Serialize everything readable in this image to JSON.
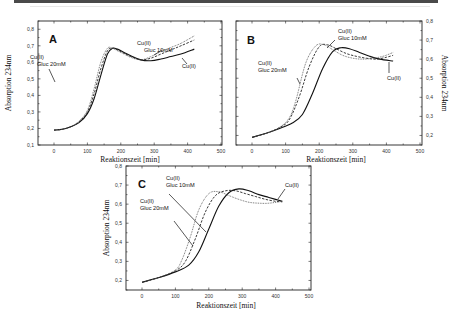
{
  "figure": {
    "legend_series": [
      "Cu(II)",
      "Cu(II) Gluc 10mM",
      "Cu(II) Gluc 20mM"
    ],
    "series_styles": {
      "Cu(II)": {
        "stroke": "#111111",
        "dash": "",
        "width": 1.1
      },
      "Cu(II) Gluc 10mM": {
        "stroke": "#222222",
        "dash": "2.4,1.4",
        "width": 0.9
      },
      "Cu(II) Gluc 20mM": {
        "stroke": "#555555",
        "dash": "0.8,0.9",
        "width": 0.9
      }
    }
  },
  "chart_data": [
    {
      "panel": "A",
      "type": "line",
      "title": "",
      "xlabel": "Reaktionszeit [min]",
      "ylabel": "Absorption 234nm",
      "ylabel_side": "left",
      "xlim": [
        -50,
        500
      ],
      "ylim": [
        0.1,
        0.85
      ],
      "xticks": [
        0,
        100,
        200,
        300,
        400,
        500
      ],
      "yticks": [
        0.1,
        0.2,
        0.3,
        0.4,
        0.5,
        0.6,
        0.7,
        0.8
      ],
      "ytick_labels": [
        "0,1",
        "0,2",
        "0,3",
        "0,4",
        "0,5",
        "0,6",
        "0,7",
        "0,8"
      ],
      "grid": false,
      "annotations": [
        {
          "text": [
            "Cu(II)",
            "Gluc 20mM"
          ],
          "x": 42,
          "y": 0.62
        },
        {
          "text": [
            "Cu(II)",
            "Gluc 10mM"
          ],
          "x": 245,
          "y": 0.77
        },
        {
          "text": [
            "Cu(II)"
          ],
          "x": 380,
          "y": 0.6
        }
      ],
      "series": [
        {
          "name": "Cu(II)",
          "x": [
            0,
            25,
            50,
            75,
            100,
            120,
            140,
            160,
            175,
            190,
            210,
            230,
            260,
            290,
            320,
            350,
            380,
            420
          ],
          "y": [
            0.19,
            0.195,
            0.21,
            0.235,
            0.29,
            0.38,
            0.52,
            0.65,
            0.685,
            0.68,
            0.66,
            0.64,
            0.615,
            0.61,
            0.62,
            0.635,
            0.65,
            0.68
          ]
        },
        {
          "name": "Cu(II) Gluc 10mM",
          "x": [
            0,
            25,
            50,
            75,
            100,
            120,
            140,
            160,
            175,
            190,
            210,
            230,
            260,
            290,
            320,
            350,
            380,
            420
          ],
          "y": [
            0.19,
            0.195,
            0.21,
            0.24,
            0.3,
            0.41,
            0.56,
            0.67,
            0.685,
            0.675,
            0.655,
            0.635,
            0.615,
            0.625,
            0.65,
            0.675,
            0.7,
            0.735
          ]
        },
        {
          "name": "Cu(II) Gluc 20mM",
          "x": [
            0,
            25,
            50,
            75,
            100,
            120,
            140,
            160,
            175,
            190,
            210,
            230,
            260,
            290,
            320,
            350,
            380,
            420
          ],
          "y": [
            0.19,
            0.195,
            0.21,
            0.245,
            0.31,
            0.44,
            0.6,
            0.685,
            0.685,
            0.67,
            0.65,
            0.63,
            0.615,
            0.635,
            0.665,
            0.69,
            0.715,
            0.76
          ]
        }
      ]
    },
    {
      "panel": "B",
      "type": "line",
      "title": "",
      "xlabel": "Reaktionszeit [min]",
      "ylabel": "Absorption 234nm",
      "ylabel_side": "right",
      "xlim": [
        -50,
        500
      ],
      "ylim": [
        0.15,
        0.8
      ],
      "xticks": [
        0,
        100,
        200,
        300,
        400,
        500
      ],
      "yticks": [
        0.2,
        0.3,
        0.4,
        0.5,
        0.6,
        0.7,
        0.8
      ],
      "ytick_labels": [
        "0,2",
        "0,3",
        "0,4",
        "0,5",
        "0,6",
        "0,7",
        "0,8"
      ],
      "grid": false,
      "annotations": [
        {
          "text": [
            "Cu(II)",
            "Gluc 20mM"
          ],
          "x": 40,
          "y": 0.6
        },
        {
          "text": [
            "Cu(II)",
            "Gluc 10mM"
          ],
          "x": 260,
          "y": 0.71
        },
        {
          "text": [
            "Cu(II)"
          ],
          "x": 380,
          "y": 0.54
        }
      ],
      "series": [
        {
          "name": "Cu(II)",
          "x": [
            0,
            40,
            80,
            120,
            150,
            180,
            210,
            240,
            265,
            290,
            320,
            350,
            380,
            420
          ],
          "y": [
            0.19,
            0.21,
            0.235,
            0.265,
            0.31,
            0.42,
            0.55,
            0.64,
            0.66,
            0.655,
            0.635,
            0.615,
            0.6,
            0.59
          ]
        },
        {
          "name": "Cu(II) Gluc 10mM",
          "x": [
            0,
            40,
            80,
            110,
            140,
            170,
            200,
            225,
            250,
            280,
            310,
            340,
            370,
            400,
            420
          ],
          "y": [
            0.19,
            0.21,
            0.24,
            0.28,
            0.4,
            0.56,
            0.665,
            0.675,
            0.655,
            0.63,
            0.615,
            0.605,
            0.6,
            0.61,
            0.62
          ]
        },
        {
          "name": "Cu(II) Gluc 20mM",
          "x": [
            0,
            40,
            80,
            110,
            130,
            160,
            190,
            215,
            240,
            270,
            300,
            330,
            360,
            390,
            420
          ],
          "y": [
            0.19,
            0.21,
            0.24,
            0.29,
            0.38,
            0.58,
            0.67,
            0.675,
            0.65,
            0.62,
            0.605,
            0.6,
            0.605,
            0.615,
            0.635
          ]
        }
      ]
    },
    {
      "panel": "C",
      "type": "line",
      "title": "",
      "xlabel": "Reaktionszeit [min]",
      "ylabel": "Absorption 234nm",
      "ylabel_side": "left",
      "xlim": [
        -50,
        500
      ],
      "ylim": [
        0.15,
        0.8
      ],
      "xticks": [
        0,
        100,
        200,
        300,
        400,
        500
      ],
      "yticks": [
        0.2,
        0.3,
        0.4,
        0.5,
        0.6,
        0.7,
        0.8
      ],
      "ytick_labels": [
        "0,2",
        "0,3",
        "0,4",
        "0,5",
        "0,6",
        "0,7",
        "0,8"
      ],
      "grid": false,
      "annotations": [
        {
          "text": [
            "Cu(II)",
            "Gluc 10mM"
          ],
          "x": 70,
          "y": 0.72
        },
        {
          "text": [
            "Cu(II)",
            "Gluc 20mM"
          ],
          "x": 35,
          "y": 0.6
        },
        {
          "text": [
            "Cu(II)"
          ],
          "x": 420,
          "y": 0.69
        }
      ],
      "series": [
        {
          "name": "Cu(II)",
          "x": [
            0,
            50,
            100,
            140,
            170,
            200,
            230,
            260,
            290,
            320,
            350,
            380,
            420
          ],
          "y": [
            0.19,
            0.215,
            0.245,
            0.28,
            0.35,
            0.47,
            0.59,
            0.66,
            0.68,
            0.67,
            0.65,
            0.635,
            0.615
          ]
        },
        {
          "name": "Cu(II) Gluc 10mM",
          "x": [
            0,
            50,
            100,
            130,
            160,
            190,
            220,
            250,
            280,
            310,
            340,
            370,
            400,
            420
          ],
          "y": [
            0.19,
            0.215,
            0.25,
            0.3,
            0.42,
            0.56,
            0.645,
            0.67,
            0.67,
            0.655,
            0.64,
            0.625,
            0.615,
            0.612
          ]
        },
        {
          "name": "Cu(II) Gluc 20mM",
          "x": [
            0,
            50,
            100,
            120,
            145,
            170,
            200,
            230,
            260,
            290,
            320,
            350,
            380,
            420
          ],
          "y": [
            0.19,
            0.215,
            0.255,
            0.31,
            0.43,
            0.57,
            0.655,
            0.665,
            0.645,
            0.625,
            0.61,
            0.605,
            0.605,
            0.615
          ]
        }
      ]
    }
  ],
  "layout_px": [
    {
      "frame": [
        38,
        21,
        222,
        145
      ],
      "x0px": 54,
      "x500px": 221,
      "ytop": 0.85,
      "ybot": 0.1,
      "yaxis": "left",
      "letter_pos": [
        49,
        43
      ],
      "xlabel_pos": [
        130,
        162
      ],
      "ylabel_pos": [
        11,
        83
      ],
      "annot_px": [
        [
          30,
          59,
          37,
          66
        ],
        [
          137,
          45,
          144,
          52
        ],
        [
          182,
          68
        ]
      ],
      "leaders": [
        [
          49,
          69,
          55,
          82
        ],
        [
          154,
          55,
          162,
          50
        ],
        [
          187,
          64,
          182,
          58
        ]
      ]
    },
    {
      "frame": [
        236,
        21,
        422,
        145
      ],
      "x0px": 252,
      "x500px": 420,
      "ytop": 0.8,
      "ybot": 0.15,
      "yaxis": "right",
      "letter_pos": [
        247,
        44
      ],
      "xlabel_pos": [
        336,
        162
      ],
      "ylabel_pos": [
        442,
        83
      ],
      "annot_px": [
        [
          258,
          65,
          258,
          72
        ],
        [
          338,
          33,
          338,
          40
        ],
        [
          387,
          80
        ]
      ],
      "leaders": [
        [
          297,
          78,
          300,
          84
        ],
        [
          335,
          40,
          327,
          48
        ],
        [
          389,
          73,
          389,
          62
        ]
      ]
    },
    {
      "frame": [
        126,
        166,
        311,
        290
      ],
      "x0px": 142,
      "x500px": 309,
      "ytop": 0.8,
      "ybot": 0.15,
      "yaxis": "left",
      "letter_pos": [
        138,
        188
      ],
      "xlabel_pos": [
        226,
        308
      ],
      "ylabel_pos": [
        109,
        228
      ],
      "annot_px": [
        [
          166,
          180,
          166,
          187
        ],
        [
          140,
          203,
          140,
          210
        ],
        [
          285,
          187
        ]
      ],
      "leaders": [
        [
          169,
          194,
          206,
          232
        ],
        [
          174,
          221,
          193,
          246
        ],
        [
          285,
          189,
          278,
          199
        ]
      ]
    }
  ]
}
